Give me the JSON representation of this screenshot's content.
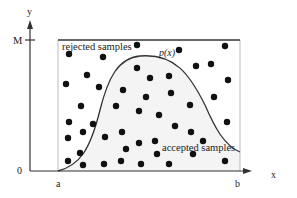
{
  "axes": {
    "x_label": "x",
    "y_label": "y",
    "origin_label": "0",
    "y_max_label": "M",
    "x_start_label": "a",
    "x_end_label": "b"
  },
  "curve": {
    "label": "p(x)"
  },
  "regions": {
    "rejected_label": "rejected samples",
    "accepted_label": "accepted samples"
  },
  "colors": {
    "axis": "#333333",
    "curve": "#333333",
    "accepted_fill": "#f4f4f4",
    "dot": "#111111",
    "box": "#777777"
  },
  "samples": [
    [
      69,
      54
    ],
    [
      103,
      57
    ],
    [
      137,
      45
    ],
    [
      179,
      50
    ],
    [
      225,
      46
    ],
    [
      87,
      75
    ],
    [
      66,
      84
    ],
    [
      99,
      87
    ],
    [
      123,
      90
    ],
    [
      137,
      68
    ],
    [
      150,
      78
    ],
    [
      169,
      76
    ],
    [
      146,
      97
    ],
    [
      171,
      93
    ],
    [
      196,
      66
    ],
    [
      211,
      64
    ],
    [
      228,
      80
    ],
    [
      214,
      97
    ],
    [
      81,
      106
    ],
    [
      116,
      106
    ],
    [
      139,
      111
    ],
    [
      159,
      115
    ],
    [
      190,
      105
    ],
    [
      69,
      122
    ],
    [
      93,
      124
    ],
    [
      83,
      132
    ],
    [
      68,
      138
    ],
    [
      105,
      137
    ],
    [
      122,
      132
    ],
    [
      139,
      143
    ],
    [
      155,
      141
    ],
    [
      175,
      126
    ],
    [
      191,
      132
    ],
    [
      203,
      141
    ],
    [
      227,
      122
    ],
    [
      80,
      153
    ],
    [
      126,
      149
    ],
    [
      157,
      154
    ],
    [
      193,
      154
    ],
    [
      68,
      161
    ],
    [
      83,
      165
    ],
    [
      104,
      164
    ],
    [
      121,
      161
    ],
    [
      141,
      164
    ],
    [
      169,
      164
    ],
    [
      225,
      161
    ]
  ]
}
